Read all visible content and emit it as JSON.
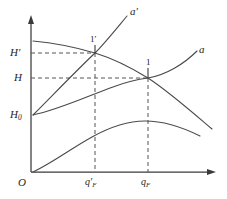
{
  "figure": {
    "name": "pump-characteristic-curves",
    "background_color": "#ffffff",
    "line_color": "#4a4a4a",
    "axis_color": "#3a3a3a"
  },
  "axes": {
    "origin_label": "O",
    "y_axis_name": "head-axis",
    "x_axis_name": "flow-axis",
    "y_ticks": [
      {
        "label_main": "H",
        "label_prime": "′",
        "label_sub": "",
        "value_y": 53
      },
      {
        "label_main": "H",
        "label_prime": "",
        "label_sub": "",
        "value_y": 78
      },
      {
        "label_main": "H",
        "label_prime": "",
        "label_sub": "0",
        "value_y": 115
      }
    ],
    "x_ticks": [
      {
        "label_main": "q",
        "label_prime": "′",
        "label_sub": "F",
        "value_x": 95
      },
      {
        "label_main": "q",
        "label_prime": "",
        "label_sub": "F",
        "value_x": 148
      }
    ]
  },
  "curves": [
    {
      "name": "pump-head-curve",
      "description": "descending characteristic curve",
      "label": ""
    },
    {
      "name": "system-curve-a-prime",
      "description": "steep rising resistance curve",
      "label": "a",
      "label_prime": "′"
    },
    {
      "name": "system-curve-a",
      "description": "shallow rising resistance curve",
      "label": "a",
      "label_prime": ""
    },
    {
      "name": "efficiency-curve",
      "description": "bottom parabolic efficiency curve",
      "label": ""
    }
  ],
  "operating_points": [
    {
      "name": "operating-point-1-prime",
      "label_main": "1",
      "label_prime": "′",
      "x": 95,
      "y": 53
    },
    {
      "name": "operating-point-1",
      "label_main": "1",
      "label_prime": "",
      "x": 148,
      "y": 78
    }
  ]
}
